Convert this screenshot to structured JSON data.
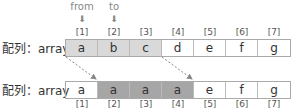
{
  "pointers": [
    {
      "label": "from",
      "index": 1
    },
    {
      "label": "to",
      "index": 2
    }
  ],
  "arrow_glyph": "⬇",
  "row_label": "配列：array",
  "indices": [
    "[1]",
    "[2]",
    "[3]",
    "[4]",
    "[5]",
    "[6]",
    "[7]"
  ],
  "before": {
    "cells": [
      "a",
      "b",
      "c",
      "d",
      "e",
      "f",
      "g"
    ]
  },
  "after": {
    "cells": [
      "a",
      "a",
      "a",
      "a",
      "e",
      "f",
      "g"
    ]
  },
  "colors": {
    "highlight_light": "#d9d9d9",
    "highlight_dark": "#a6a6a6"
  }
}
